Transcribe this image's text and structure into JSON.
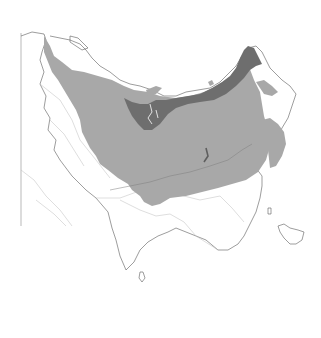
{
  "map": {
    "type": "species range map",
    "region": "Northern Eurasia (Europe, Russia, Central Asia, South Asia, East Asia)",
    "background_color": "#ffffff",
    "colors": {
      "main_range": "#a8a8a8",
      "arctic_coastal_range": "#6e6e6e",
      "land_outline": "#5a5a5a",
      "country_borders": "#bdbdbd"
    },
    "layers": [
      {
        "id": "main-range",
        "description": "Primary distribution area (light gray)",
        "color": "#a8a8a8"
      },
      {
        "id": "northern-range",
        "description": "Northern/Arctic coastal distribution band (dark gray)",
        "color": "#6e6e6e"
      }
    ],
    "labels": []
  }
}
